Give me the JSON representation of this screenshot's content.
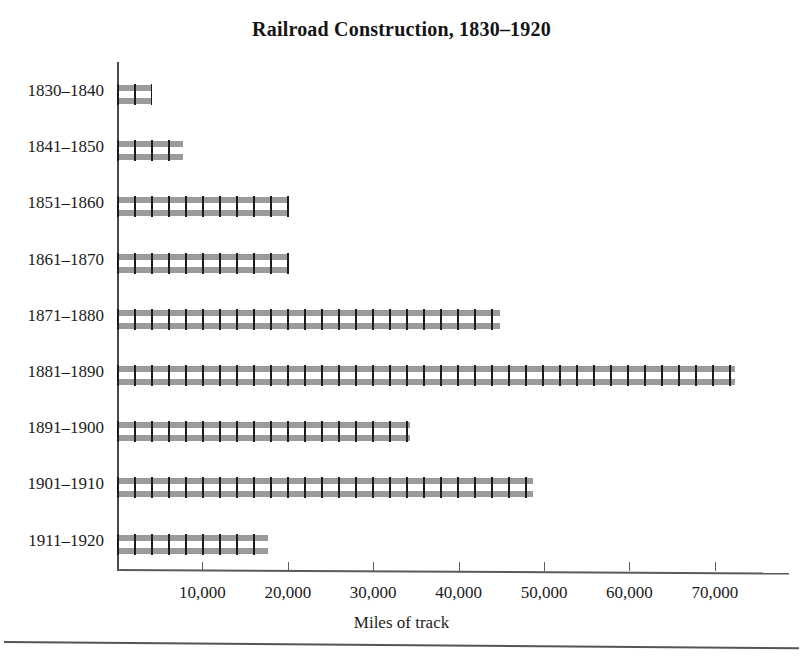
{
  "figure": {
    "title": "Railroad Construction, 1830–1920",
    "bottom_rule": true
  },
  "axis": {
    "x_title": "Miles of track",
    "x_ticks": [
      "10,000",
      "20,000",
      "30,000",
      "40,000",
      "50,000",
      "60,000",
      "70,000"
    ],
    "y_categories": [
      "1830–1840",
      "1841–1850",
      "1851–1860",
      "1861–1870",
      "1871–1880",
      "1881–1890",
      "1891–1900",
      "1901–1910",
      "1911–1920"
    ]
  },
  "style": {
    "rail_color": "#9b9b9b",
    "tie_color": "#1c1c1c",
    "axis_color": "#4a4a4a",
    "text_color": "#1b1b1b",
    "background": "#ffffff"
  },
  "chart_data": {
    "type": "bar",
    "orientation": "horizontal",
    "title": "Railroad Construction, 1830–1920",
    "xlabel": "Miles of track",
    "ylabel": "",
    "categories": [
      "1830–1840",
      "1841–1850",
      "1851–1860",
      "1861–1870",
      "1871–1880",
      "1881–1890",
      "1891–1900",
      "1901–1910",
      "1911–1920"
    ],
    "values": [
      4100,
      7700,
      20100,
      20100,
      44900,
      72400,
      34300,
      48700,
      17700
    ],
    "xlim": [
      0,
      78700
    ],
    "xticks": [
      10000,
      20000,
      30000,
      40000,
      50000,
      60000,
      70000
    ],
    "xtick_labels": [
      "10,000",
      "20,000",
      "30,000",
      "40,000",
      "50,000",
      "60,000",
      "70,000"
    ],
    "grid": false,
    "legend": false,
    "bar_style": "railroad-track (two gray rails with black cross ties)"
  }
}
